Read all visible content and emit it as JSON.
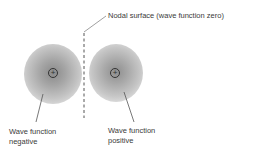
{
  "diagram": {
    "nodal_surface": {
      "label": "Nodal surface (wave function zero)"
    },
    "left_lobe": {
      "nucleus_symbol": "+",
      "label_line1": "Wave function",
      "label_line2": "negative"
    },
    "right_lobe": {
      "nucleus_symbol": "+",
      "label_line1": "Wave function",
      "label_line2": "positive"
    },
    "colors": {
      "cloud": "#8a8a8a",
      "line": "#555555",
      "text": "#3a3a3a",
      "background": "#ffffff"
    }
  }
}
